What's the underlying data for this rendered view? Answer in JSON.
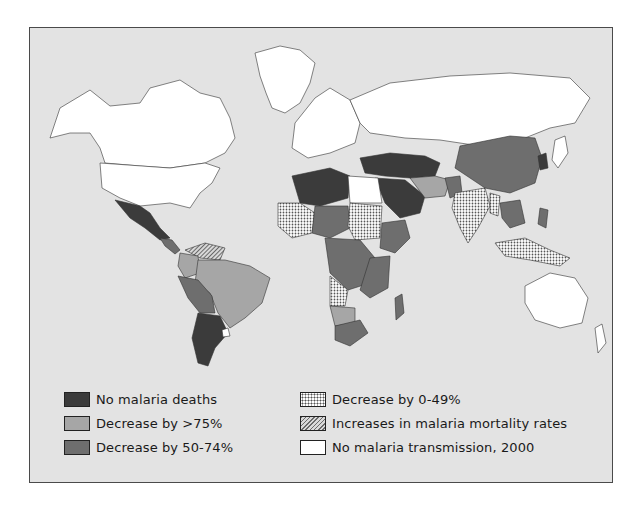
{
  "map": {
    "title": "",
    "background_color": "#e3e3e3",
    "categories": {
      "no_deaths": {
        "label": "No malaria deaths",
        "color": "#3b3b3b",
        "pattern": "solid"
      },
      "decrease_gt75": {
        "label": "Decrease by >75%",
        "color": "#a6a6a6",
        "pattern": "solid"
      },
      "decrease_50_74": {
        "label": "Decrease by 50-74%",
        "color": "#6e6e6e",
        "pattern": "solid"
      },
      "decrease_0_49": {
        "label": "Decrease by 0-49%",
        "color": "#ffffff",
        "pattern": "dots"
      },
      "increase": {
        "label": "Increases in malaria mortality rates",
        "color": "#d8d8d8",
        "pattern": "hatch"
      },
      "no_transmission": {
        "label": "No malaria transmission, 2000",
        "color": "#ffffff",
        "pattern": "solid"
      }
    }
  },
  "legend": {
    "items": [
      {
        "label": "No malaria deaths",
        "swatch": "dark"
      },
      {
        "label": "Decrease by >75%",
        "swatch": "light"
      },
      {
        "label": "Decrease by 50-74%",
        "swatch": "mid"
      },
      {
        "label": "Decrease by 0-49%",
        "swatch": "dots"
      },
      {
        "label": "Increases in malaria mortality rates",
        "swatch": "hatch"
      },
      {
        "label": "No malaria transmission, 2000",
        "swatch": "white"
      }
    ]
  }
}
